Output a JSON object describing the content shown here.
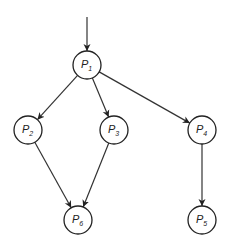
{
  "diagram": {
    "type": "directed-graph",
    "colors": {
      "stroke": "#222222",
      "fill": "#ffffff"
    },
    "entry_arrow": {
      "from": [
        87,
        17
      ],
      "to": "P1"
    },
    "nodes": [
      {
        "id": "P1",
        "label": "P",
        "sub": "1",
        "x": 87,
        "y": 65
      },
      {
        "id": "P2",
        "label": "P",
        "sub": "2",
        "x": 28,
        "y": 130
      },
      {
        "id": "P3",
        "label": "P",
        "sub": "3",
        "x": 114,
        "y": 130
      },
      {
        "id": "P4",
        "label": "P",
        "sub": "4",
        "x": 202,
        "y": 130
      },
      {
        "id": "P6",
        "label": "P",
        "sub": "6",
        "x": 78,
        "y": 220
      },
      {
        "id": "P5",
        "label": "P",
        "sub": "5",
        "x": 202,
        "y": 220
      }
    ],
    "edges": [
      {
        "from": "P1",
        "to": "P2"
      },
      {
        "from": "P1",
        "to": "P3"
      },
      {
        "from": "P1",
        "to": "P4"
      },
      {
        "from": "P2",
        "to": "P6"
      },
      {
        "from": "P3",
        "to": "P6"
      },
      {
        "from": "P4",
        "to": "P5"
      }
    ]
  }
}
